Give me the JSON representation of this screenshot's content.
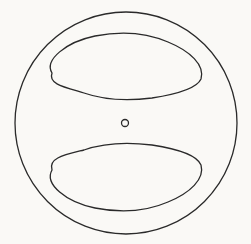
{
  "figure": {
    "type": "line-drawing",
    "background": "#faf9f6",
    "stroke_color": "#2a2a2a",
    "stroke_width": 1.3,
    "outer_circle": {
      "cx": 126,
      "cy": 123,
      "r": 111
    },
    "center_hole": {
      "cx": 125,
      "cy": 123,
      "r": 3.5
    },
    "top_opening": {
      "path": "M 52 73 C 44 60, 66 42, 95 36 C 120 31, 145 32, 168 42 C 190 51, 205 65, 201 79 C 197 88, 178 94, 152 98 C 128 101, 104 100, 84 93 C 64 87, 48 84, 52 73 Z"
    },
    "bottom_opening": {
      "path": "M 52 170 C 48 158, 64 155, 84 150 C 104 143, 128 142, 152 145 C 178 149, 197 155, 201 165 C 205 179, 190 193, 168 202 C 145 212, 120 213, 95 208 C 66 202, 44 184, 52 170 Z"
    }
  }
}
